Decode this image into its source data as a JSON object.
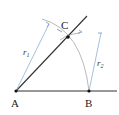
{
  "diagram": {
    "title": "",
    "points": {
      "A": {
        "label": "A",
        "x": 16,
        "y": 91
      },
      "B": {
        "label": "B",
        "x": 89,
        "y": 91
      },
      "C": {
        "label": "C",
        "x": 68,
        "y": 37
      }
    },
    "radii": {
      "r1": {
        "label": "r",
        "subscript": "1"
      },
      "r2": {
        "label": "r",
        "subscript": "2"
      }
    },
    "colors": {
      "line": "#222222",
      "construction": "#7fa6cf",
      "arc": "#888888"
    }
  }
}
